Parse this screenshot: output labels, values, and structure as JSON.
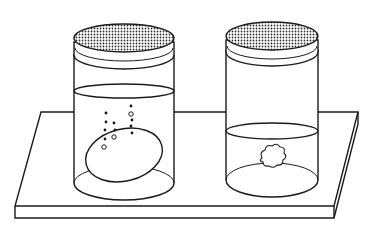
{
  "figure": {
    "colors": {
      "stroke": "#1a1a1a",
      "background": "#ffffff",
      "lid_fill": "#9a9a9a"
    }
  },
  "jars": [
    {
      "id": "left",
      "contents": "egg",
      "bubbles": true,
      "liquid_level": "high"
    },
    {
      "id": "right",
      "contents": "shriveled-mass",
      "bubbles": false,
      "liquid_level": "low"
    }
  ]
}
